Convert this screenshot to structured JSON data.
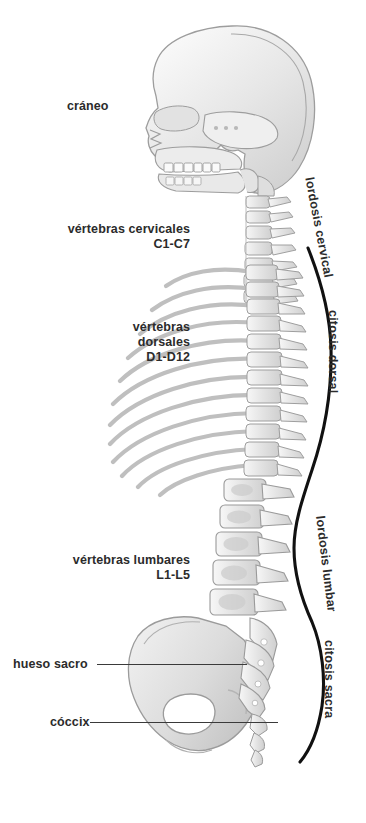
{
  "figure": {
    "background_color": "#ffffff",
    "text_color": "#2b2b2b",
    "bone_fill": "#e8e8e8",
    "bone_stroke": "#9a9a9a",
    "curve_color": "#1a1a1a"
  },
  "labels": {
    "skull": "cráneo",
    "cervical": "vértebras cervicales\nC1-C7",
    "dorsal": "vértebras\ndorsales\nD1-D12",
    "lumbar": "vértebras lumbares\nL1-L5",
    "sacrum": "hueso sacro",
    "coccyx": "cóccix"
  },
  "curve_labels": {
    "cervical": "lordosis cervical",
    "dorsal": "citosis dorsal",
    "lumbar": "lordosis lumbar",
    "sacral": "citosis sacra"
  }
}
